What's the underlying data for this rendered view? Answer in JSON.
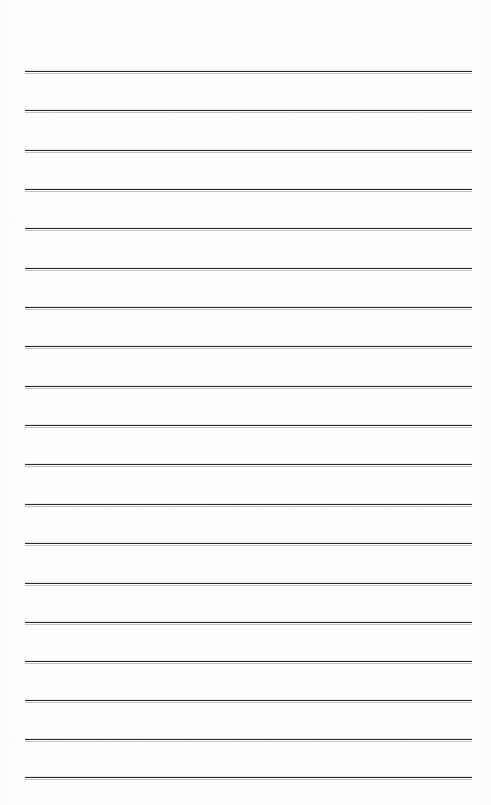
{
  "document": {
    "kind": "scanned-lined-paper",
    "title": "Lined Paper Scan",
    "page_width": 491,
    "page_height": 805,
    "background_color": "#fefefe",
    "text_content": "",
    "writing_present": "none"
  },
  "ruling": {
    "line_color": "#26282b",
    "line_thickness_px": 1.7,
    "line_left_x": 25,
    "line_right_x": 472,
    "line_length_px": 447,
    "first_line_y": 71,
    "last_line_y": 777,
    "line_spacing_px": 39.2,
    "line_count": 19,
    "top_margin_px": 71,
    "bottom_margin_px": 28,
    "left_margin_px": 25,
    "right_margin_px": 19,
    "line_y_positions": [
      71,
      110,
      150,
      189,
      228,
      268,
      307,
      346,
      386,
      425,
      464,
      504,
      543,
      583,
      622,
      661,
      700,
      739,
      777
    ]
  }
}
